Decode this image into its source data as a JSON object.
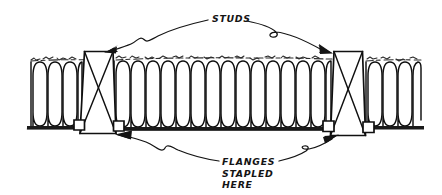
{
  "figure": {
    "background_color": "#ffffff",
    "ink_color": "#141414",
    "width": 442,
    "height": 195
  },
  "callouts": {
    "studs": {
      "label": "STUDS",
      "x": 212,
      "y": 22,
      "leader_count": 2
    },
    "flanges": {
      "lines": [
        "FLANGES",
        "STAPLED",
        "HERE"
      ],
      "line1": "FLANGES",
      "line2": "STAPLED",
      "line3": "HERE",
      "x": 222,
      "y": 165,
      "line_height": 11.5,
      "leader_count": 2
    }
  },
  "studs": [
    {
      "name": "left-stud",
      "x": 84,
      "y": 51,
      "width": 29,
      "height": 85,
      "cross_hatch": true
    },
    {
      "name": "right-stud",
      "x": 333,
      "y": 51,
      "width": 30,
      "height": 88,
      "cross_hatch": true
    }
  ],
  "insulation": {
    "description": "serpentine batt loops",
    "bays": [
      {
        "name": "left-bay",
        "x_start": 31,
        "x_end": 82,
        "loops": 4,
        "top": 62,
        "bottom": 125
      },
      {
        "name": "center-bay",
        "x_start": 115,
        "x_end": 331,
        "loops": 16,
        "top": 62,
        "bottom": 127
      },
      {
        "name": "right-bay",
        "x_start": 366,
        "x_end": 421,
        "loops": 4,
        "top": 62,
        "bottom": 125
      }
    ],
    "fuzzy_top_edge": true,
    "fuzzy_top_y": 58
  },
  "flange": {
    "name": "stapling-flange",
    "y": 127,
    "segments": [
      {
        "x_start": 27,
        "x_end": 86
      },
      {
        "x_start": 112,
        "x_end": 335
      },
      {
        "x_start": 362,
        "x_end": 424
      }
    ]
  }
}
